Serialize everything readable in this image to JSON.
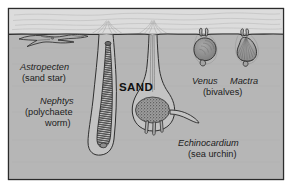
{
  "figure": {
    "substrate_label": "SAND",
    "border_color": "#2b2b2b",
    "page_background": "#ffffff",
    "water_color": "#dcdcdc",
    "sand_color": "#b6b6b6",
    "ink_color": "#2b2b2b",
    "organism_fill": "#9a9a9a",
    "organism_dark": "#555555"
  },
  "labels": {
    "astropecten": {
      "scientific": "Astropecten",
      "common": "(sand star)"
    },
    "nephtys": {
      "scientific": "Nephtys",
      "common_line1": "(polychaete",
      "common_line2": "worm)"
    },
    "echinocardium": {
      "scientific": "Echinocardium",
      "common": "(sea urchin)"
    },
    "venus": {
      "scientific": "Venus"
    },
    "mactra": {
      "scientific": "Mactra",
      "common": "(bivalves)"
    }
  },
  "organisms": [
    {
      "name": "Astropecten",
      "common_name": "sand star",
      "group": "starfish",
      "position": "surface, partly buried in sand",
      "depth_zone": "sediment surface"
    },
    {
      "name": "Nephtys",
      "common_name": "polychaete worm",
      "group": "annelid worm",
      "position": "deep U-shaped burrow",
      "depth_zone": "deep infauna"
    },
    {
      "name": "Echinocardium",
      "common_name": "sea urchin",
      "group": "heart urchin",
      "position": "buried chamber with vertical respiratory funnel to surface",
      "depth_zone": "deep infauna"
    },
    {
      "name": "Venus",
      "common_name": "bivalve",
      "group": "bivalve mollusc",
      "position": "shallow burrow with short siphons at surface",
      "depth_zone": "shallow infauna"
    },
    {
      "name": "Mactra",
      "common_name": "bivalve",
      "group": "bivalve mollusc",
      "position": "shallow burrow with short siphons at surface",
      "depth_zone": "shallow infauna"
    }
  ]
}
